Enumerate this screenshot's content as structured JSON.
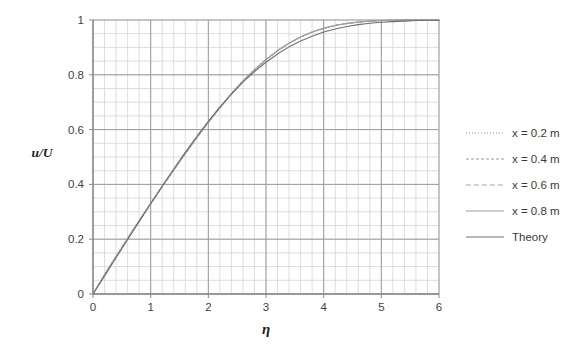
{
  "chart_data": {
    "type": "line",
    "title": "",
    "subtitle": "",
    "xlabel": "η",
    "ylabel": "u/U",
    "xlim": [
      0,
      6
    ],
    "ylim": [
      0,
      1
    ],
    "xticks": [
      "0",
      "1",
      "2",
      "3",
      "4",
      "5",
      "6"
    ],
    "yticks": [
      "0",
      "0.2",
      "0.4",
      "0.6",
      "0.8",
      "1"
    ],
    "xtick_values": [
      0,
      1,
      2,
      3,
      4,
      5,
      6
    ],
    "ytick_values": [
      0,
      0.2,
      0.4,
      0.6,
      0.8,
      1
    ],
    "grid": "major-and-minor",
    "grid_minor_x_step": 0.2,
    "grid_minor_y_step": 0.05,
    "legend_position": "right",
    "x": [
      0,
      0.2,
      0.4,
      0.6,
      0.8,
      1.0,
      1.2,
      1.4,
      1.6,
      1.8,
      2.0,
      2.2,
      2.4,
      2.6,
      2.8,
      3.0,
      3.2,
      3.4,
      3.6,
      3.8,
      4.0,
      4.2,
      4.4,
      4.6,
      4.8,
      5.0,
      5.2,
      5.4,
      5.6,
      5.8,
      6.0
    ],
    "series": [
      {
        "name": "x = 0.2 m",
        "dash": "1,2",
        "color": "#8c8c8c",
        "width": 1,
        "values": [
          0.0,
          0.073,
          0.14,
          0.206,
          0.27,
          0.332,
          0.394,
          0.456,
          0.517,
          0.575,
          0.63,
          0.684,
          0.734,
          0.78,
          0.821,
          0.858,
          0.89,
          0.917,
          0.939,
          0.957,
          0.971,
          0.981,
          0.988,
          0.993,
          0.996,
          0.998,
          0.999,
          1.0,
          1.0,
          1.0,
          1.0
        ]
      },
      {
        "name": "x = 0.4 m",
        "dash": "3,2",
        "color": "#9a9a9a",
        "width": 1,
        "values": [
          0.0,
          0.065,
          0.132,
          0.198,
          0.263,
          0.327,
          0.389,
          0.45,
          0.51,
          0.568,
          0.624,
          0.677,
          0.728,
          0.774,
          0.816,
          0.853,
          0.886,
          0.914,
          0.937,
          0.955,
          0.969,
          0.98,
          0.987,
          0.992,
          0.996,
          0.998,
          0.999,
          1.0,
          1.0,
          1.0,
          1.0
        ]
      },
      {
        "name": "x = 0.6 m",
        "dash": "5,3",
        "color": "#a5a5a5",
        "width": 1,
        "values": [
          0.0,
          0.07,
          0.137,
          0.203,
          0.268,
          0.331,
          0.392,
          0.453,
          0.513,
          0.572,
          0.628,
          0.681,
          0.731,
          0.778,
          0.819,
          0.856,
          0.888,
          0.916,
          0.938,
          0.956,
          0.97,
          0.98,
          0.987,
          0.992,
          0.996,
          0.998,
          0.999,
          1.0,
          1.0,
          1.0,
          1.0
        ]
      },
      {
        "name": "x = 0.8 m",
        "dash": "none",
        "color": "#9c9c9c",
        "width": 1,
        "values": [
          0.0,
          0.068,
          0.135,
          0.201,
          0.266,
          0.33,
          0.391,
          0.452,
          0.512,
          0.57,
          0.626,
          0.68,
          0.73,
          0.777,
          0.818,
          0.855,
          0.887,
          0.915,
          0.938,
          0.956,
          0.97,
          0.98,
          0.987,
          0.992,
          0.996,
          0.998,
          0.999,
          1.0,
          1.0,
          1.0,
          1.0
        ]
      },
      {
        "name": "Theory",
        "dash": "none",
        "color": "#707070",
        "width": 1.1,
        "values": [
          0.0,
          0.066,
          0.133,
          0.199,
          0.265,
          0.33,
          0.394,
          0.456,
          0.517,
          0.575,
          0.63,
          0.682,
          0.729,
          0.773,
          0.812,
          0.846,
          0.876,
          0.902,
          0.923,
          0.941,
          0.956,
          0.967,
          0.976,
          0.983,
          0.988,
          0.992,
          0.994,
          0.996,
          0.998,
          0.999,
          0.999
        ]
      }
    ]
  },
  "legend": {
    "items": [
      {
        "label": "x = 0.2 m"
      },
      {
        "label": "x = 0.4 m"
      },
      {
        "label": "x = 0.6 m"
      },
      {
        "label": "x = 0.8 m"
      },
      {
        "label": "Theory"
      }
    ]
  },
  "colors": {
    "background": "#ffffff",
    "major_grid": "#9c9c9c",
    "minor_grid": "#d4d4d4",
    "axis": "#8f8f8f",
    "text": "#3f3f3f"
  }
}
